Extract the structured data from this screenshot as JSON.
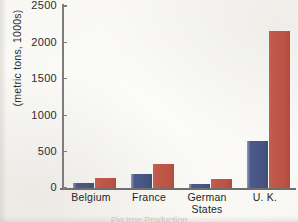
{
  "chart_data": {
    "type": "bar",
    "title": "",
    "xlabel": "",
    "ylabel": "(metric tons, 1000s)",
    "categories": [
      "Belgium",
      "France",
      "German States",
      "U. K."
    ],
    "category_lines": [
      [
        "Belgium"
      ],
      [
        "France"
      ],
      [
        "German",
        "States"
      ],
      [
        "U. K."
      ]
    ],
    "series": [
      {
        "name": "series-blue",
        "color": "#4a5a8c",
        "values": [
          70,
          190,
          55,
          650
        ]
      },
      {
        "name": "series-red",
        "color": "#c0594a",
        "values": [
          140,
          330,
          125,
          2150
        ]
      }
    ],
    "ylim": [
      0,
      2500
    ],
    "yticks": [
      0,
      500,
      1000,
      1500,
      2000,
      2500
    ],
    "ytick_labels": [
      "0",
      "500",
      "1000",
      "1500",
      "2000",
      "2500"
    ],
    "grid": false,
    "legend": "none"
  },
  "axis": {
    "y_title": "(metric tons, 1000s)"
  },
  "caption": {
    "clipped_text": "Pig Iron Production"
  }
}
